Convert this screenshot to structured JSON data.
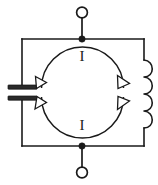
{
  "figure": {
    "background_color": "#ffffff",
    "line_color": "#1a1a1a",
    "width": 158,
    "height": 185
  },
  "labels": {
    "current_top": "I",
    "current_bottom": "I"
  },
  "components": {
    "capacitor": {
      "name": "capacitor",
      "plate_count": 2,
      "position": "left"
    },
    "inductor": {
      "name": "inductor",
      "coil_loops": 4,
      "position": "right"
    },
    "terminal_top": {
      "name": "top-terminal",
      "type": "open-circle"
    },
    "terminal_bottom": {
      "name": "bottom-terminal",
      "type": "open-circle"
    },
    "junction_top": {
      "name": "top-junction",
      "type": "filled-dot"
    },
    "junction_bottom": {
      "name": "bottom-junction",
      "type": "filled-dot"
    }
  },
  "current_arrows": {
    "top_arc": {
      "name": "top-current-arc",
      "direction": "clockwise-outward-both-ends"
    },
    "bottom_arc": {
      "name": "bottom-current-arc",
      "direction": "outward-both-ends"
    }
  }
}
